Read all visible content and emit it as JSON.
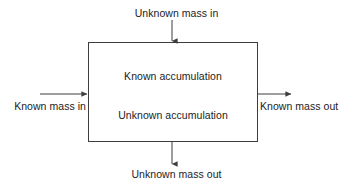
{
  "diagram": {
    "type": "block-flow-diagram",
    "stroke_color": "#3d3d3d",
    "text_color": "#1c1c1c",
    "background_color": "#ffffff",
    "control_volume": {
      "label": "control-volume-box",
      "x": 88,
      "y": 42,
      "width": 170,
      "height": 100,
      "interior_labels": [
        {
          "id": "known-accumulation",
          "text": "Known accumulation"
        },
        {
          "id": "unknown-accumulation",
          "text": "Unknown accumulation"
        }
      ]
    },
    "flows": [
      {
        "id": "unknown-mass-in",
        "text": "Unknown mass in",
        "direction": "into-box",
        "side": "top",
        "arrow_from": {
          "x": 172,
          "y": 20
        },
        "arrow_to": {
          "x": 172,
          "y": 42
        }
      },
      {
        "id": "known-mass-in",
        "text": "Known mass in",
        "direction": "into-box",
        "side": "left",
        "arrow_from": {
          "x": 40,
          "y": 94
        },
        "arrow_to": {
          "x": 88,
          "y": 94
        }
      },
      {
        "id": "known-mass-out",
        "text": "Known mass out",
        "direction": "out-of-box",
        "side": "right",
        "arrow_from": {
          "x": 258,
          "y": 94
        },
        "arrow_to": {
          "x": 292,
          "y": 94
        }
      },
      {
        "id": "unknown-mass-out",
        "text": "Unknown mass out",
        "direction": "out-of-box",
        "side": "bottom",
        "arrow_from": {
          "x": 172,
          "y": 142
        },
        "arrow_to": {
          "x": 172,
          "y": 165
        }
      }
    ]
  }
}
